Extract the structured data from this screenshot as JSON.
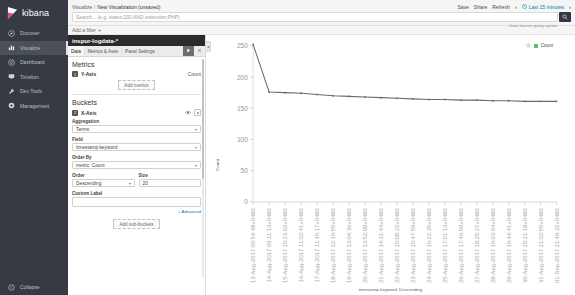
{
  "sidebar": {
    "brand": "kibana",
    "items": [
      {
        "label": "Discover",
        "icon": "compass-icon"
      },
      {
        "label": "Visualize",
        "icon": "bar-chart-icon"
      },
      {
        "label": "Dashboard",
        "icon": "dashboard-icon"
      },
      {
        "label": "Timelion",
        "icon": "monitor-icon"
      },
      {
        "label": "Dev Tools",
        "icon": "wrench-icon"
      },
      {
        "label": "Management",
        "icon": "gear-icon"
      }
    ],
    "active_index": 1,
    "collapse_label": "Collapse"
  },
  "topbar": {
    "breadcrumb_root": "Visualize",
    "breadcrumb_sep": "/",
    "breadcrumb_current": "New Visualization (unsaved)",
    "actions": [
      "Save",
      "Share",
      "Refresh"
    ],
    "time_prev": "‹",
    "time_next": "›",
    "time_range": "Last 15 minutes",
    "search_placeholder": "Search... (e.g. status:200 AND extension:PHP)",
    "search_value": "",
    "lucene_hint": "Uses lucene query syntax",
    "search_button_icon": "search-icon",
    "filter_label": "Add a filter",
    "filter_plus": "+"
  },
  "editor": {
    "index_title": "inspur-logdata-*",
    "tabs": [
      {
        "label": "Data",
        "active": true
      },
      {
        "label": "Metrics & Axes",
        "active": false
      },
      {
        "label": "Panel Settings",
        "active": false
      }
    ],
    "apply_icon": "play-icon",
    "close_icon": "close-icon",
    "metrics": {
      "title": "Metrics",
      "agg_handle": "1",
      "agg_name": "Y-Axis",
      "agg_value": "Count",
      "add_label": "Add metrics"
    },
    "buckets": {
      "title": "Buckets",
      "agg_handle": "2",
      "agg_name": "X-Axis",
      "eye_icon": "eye-icon",
      "remove_icon": "remove-icon",
      "aggregation_label": "Aggregation",
      "aggregation_value": "Terms",
      "field_label": "Field",
      "field_value": "timestamp.keyword",
      "order_by_label": "Order By",
      "order_by_value": "metric: Count",
      "order_label": "Order",
      "order_value": "Descending",
      "size_label": "Size",
      "size_value": "20",
      "custom_label_label": "Custom Label",
      "custom_label_value": "",
      "advanced_label": "+ Advanced",
      "add_sub_label": "Add sub-buckets"
    }
  },
  "chart_panel": {
    "collapse_icon": "chevron-left-icon",
    "legend_gear_icon": "gear-icon",
    "legend_label": "Count",
    "legend_color": "#57c17b"
  },
  "chart_data": {
    "type": "line",
    "title": "",
    "xlabel": "timestamp.keyword: Descending",
    "ylabel": "Count",
    "ylim": [
      0,
      250
    ],
    "yticks": [
      0,
      50,
      100,
      150,
      200,
      250
    ],
    "ytick_labels": [
      "0",
      "50",
      "100",
      "150",
      "200",
      "250"
    ],
    "grid": false,
    "legend_position": "top-right",
    "series": [
      {
        "name": "Count",
        "color": "#6a6a6a",
        "values": [
          252,
          176,
          175,
          174,
          172,
          170,
          169,
          168,
          167,
          166,
          165,
          164,
          164,
          163,
          163,
          162,
          162,
          161,
          161,
          161
        ]
      }
    ],
    "categories": [
      "13-Aug-2017 09:54:48+0480",
      "14-Aug-2017 09:11:13+0480",
      "15-Aug-2017 10:23:02+0480",
      "16-Aug-2017 11:02:41+0480",
      "17-Aug-2017 11:45:17+0480",
      "18-Aug-2017 12:19:55+0480",
      "19-Aug-2017 13:04:36+0480",
      "20-Aug-2017 13:52:08+0480",
      "21-Aug-2017 14:31:44+0480",
      "22-Aug-2017 15:08:22+0480",
      "23-Aug-2017 15:47:59+0480",
      "24-Aug-2017 16:22:35+0480",
      "25-Aug-2017 17:01:13+0480",
      "26-Aug-2017 17:46:50+0480",
      "27-Aug-2017 18:25:27+0480",
      "28-Aug-2017 19:03:04+0480",
      "29-Aug-2017 19:44:41+0480",
      "30-Aug-2017 20:21:18+0480",
      "31-Aug-2017 21:02:55+0480",
      "01-Sep-2017 21:40:32+0480"
    ]
  }
}
